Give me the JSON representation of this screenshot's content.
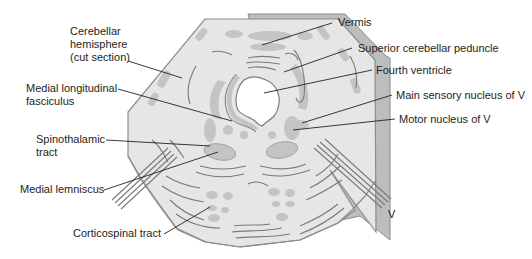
{
  "diagram": {
    "colors": {
      "tissue_fill": "#e6e6e6",
      "tissue_outline": "#8c8c8c",
      "side_rim": "#bdbdbd",
      "nuclei_fill": "#c4c4c4",
      "fiber_line": "#7a7a7a",
      "ventricle": "#ffffff",
      "leader_line": "#222222",
      "text": "#1e1e1e"
    },
    "labels": {
      "cerebellar_hemisphere": [
        "Cerebellar",
        "hemisphere",
        "(cut section)"
      ],
      "mlf": [
        "Medial longitudinal",
        "fasciculus"
      ],
      "spinothalamic": [
        "Spinothalamic",
        "tract"
      ],
      "medial_lemniscus": "Medial lemniscus",
      "corticospinal": "Corticospinal tract",
      "vermis": "Vermis",
      "scp": "Superior cerebellar peduncle",
      "fourth_ventricle": "Fourth ventricle",
      "main_sensory": "Main sensory nucleus of V",
      "motor_nucleus": "Motor nucleus of V",
      "trigeminal_nerve": "V"
    }
  }
}
